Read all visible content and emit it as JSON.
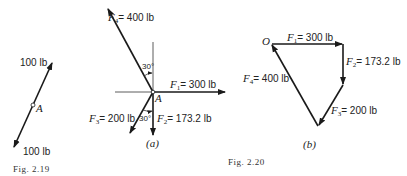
{
  "fig_2_19": {
    "caption": "Fig. 2.19",
    "point_label": "A",
    "force_top": "100 lb",
    "force_bottom": "100 lb"
  },
  "fig_2_20": {
    "caption": "Fig. 2.20",
    "part_a": {
      "label": "(a)",
      "point_label": "A",
      "angle_top": "30°",
      "angle_bottom": "30°",
      "forces": [
        {
          "name": "F",
          "sub": "1",
          "value": "= 300 lb"
        },
        {
          "name": "F",
          "sub": "2",
          "value": "= 173.2 lb"
        },
        {
          "name": "F",
          "sub": "3",
          "value": "= 200 lb"
        },
        {
          "name": "F",
          "sub": "4",
          "value": "= 400 lb"
        }
      ]
    },
    "part_b": {
      "label": "(b)",
      "origin_label": "O",
      "forces": [
        {
          "name": "F",
          "sub": "1",
          "value": "= 300 lb"
        },
        {
          "name": "F",
          "sub": "2",
          "value": "= 173.2 lb"
        },
        {
          "name": "F",
          "sub": "3",
          "value": "= 200 lb"
        },
        {
          "name": "F",
          "sub": "4",
          "value": "= 400 lb"
        }
      ]
    }
  }
}
